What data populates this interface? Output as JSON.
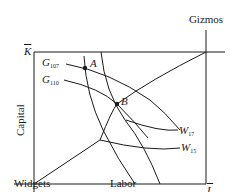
{
  "diagram": {
    "type": "edgeworth-box-production",
    "origins": {
      "widgets": "Widgets",
      "gizmos": "Gizmos"
    },
    "axes": {
      "horizontal": "Labor",
      "vertical": "Capital",
      "labor_total": "L",
      "capital_total": "K"
    },
    "isoquants": {
      "gizmos": [
        {
          "symbol": "G",
          "subscript": "107"
        },
        {
          "symbol": "G",
          "subscript": "110"
        }
      ],
      "widgets": [
        {
          "symbol": "W",
          "subscript": "17"
        },
        {
          "symbol": "W",
          "subscript": "15"
        }
      ]
    },
    "points": [
      {
        "label": "A"
      },
      {
        "label": "B"
      }
    ],
    "colors": {
      "line": "#1a1a1a",
      "background": "#ffffff"
    }
  }
}
